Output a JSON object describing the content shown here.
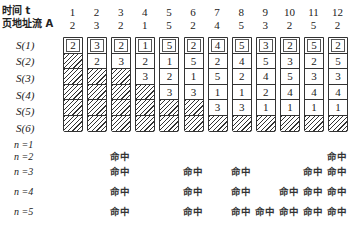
{
  "labels": {
    "time": "时间 t",
    "address_stream": "页地址流 A",
    "stack_rows": [
      "S(1)",
      "S(2)",
      "S(3)",
      "S(4)",
      "S(5)",
      "S(6)"
    ],
    "n_rows": [
      "n =1",
      "n =2",
      "n =3",
      "n =4",
      "n =5"
    ],
    "hit_text": "命中"
  },
  "time": [
    "1",
    "2",
    "3",
    "4",
    "5",
    "6",
    "7",
    "8",
    "9",
    "10",
    "11",
    "12"
  ],
  "address": [
    "2",
    "3",
    "2",
    "1",
    "5",
    "2",
    "4",
    "5",
    "3",
    "2",
    "5",
    "2"
  ],
  "stacks": [
    [
      "2",
      "",
      "",
      "",
      "",
      ""
    ],
    [
      "3",
      "2",
      "",
      "",
      "",
      ""
    ],
    [
      "2",
      "3",
      "",
      "",
      "",
      ""
    ],
    [
      "1",
      "2",
      "3",
      "",
      "",
      ""
    ],
    [
      "5",
      "1",
      "2",
      "3",
      "",
      ""
    ],
    [
      "2",
      "5",
      "1",
      "3",
      "",
      ""
    ],
    [
      "4",
      "2",
      "5",
      "1",
      "3",
      ""
    ],
    [
      "5",
      "4",
      "2",
      "1",
      "3",
      ""
    ],
    [
      "3",
      "5",
      "4",
      "2",
      "1",
      ""
    ],
    [
      "2",
      "3",
      "5",
      "4",
      "1",
      ""
    ],
    [
      "5",
      "2",
      "3",
      "4",
      "1",
      ""
    ],
    [
      "2",
      "5",
      "3",
      "4",
      "1",
      ""
    ]
  ],
  "hits": {
    "n1": [],
    "n2": [
      3,
      12
    ],
    "n3": [
      3,
      6,
      8,
      11,
      12
    ],
    "n4": [
      3,
      6,
      8,
      10,
      11,
      12
    ],
    "n5": [
      3,
      6,
      8,
      9,
      10,
      11,
      12
    ]
  }
}
